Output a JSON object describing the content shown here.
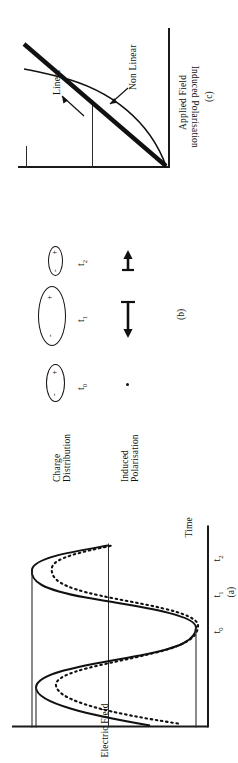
{
  "figure": {
    "orientation": "rotated-90-ccw",
    "ink_color": "#111111"
  },
  "panel_a": {
    "letter": "(a)",
    "y_axis_label": "Electric Field",
    "x_axis_label": "Time",
    "ticks": [
      {
        "label": "t",
        "sub": "0"
      },
      {
        "label": "t",
        "sub": "1"
      },
      {
        "label": "t",
        "sub": "2"
      }
    ],
    "series": [
      {
        "name": "applied-field-wave",
        "style": "solid",
        "type": "sine"
      },
      {
        "name": "polarisation-wave",
        "style": "dotted",
        "type": "distorted-sine"
      }
    ]
  },
  "panel_b": {
    "letter": "(b)",
    "row_labels": [
      {
        "line1": "Charge",
        "line2": "Distribution"
      },
      {
        "line1": "Induced",
        "line2": "Polarisation"
      }
    ],
    "columns": [
      {
        "time_label": "t",
        "time_sub": "0",
        "charge_shape": "ellipse-medium",
        "charge_signs": [
          "-",
          "+"
        ],
        "polarisation_marker": "dot"
      },
      {
        "time_label": "t",
        "time_sub": "1",
        "charge_shape": "ellipse-large",
        "charge_signs": [
          "-",
          "+"
        ],
        "polarisation_marker": "long-arrow-left"
      },
      {
        "time_label": "t",
        "time_sub": "2",
        "charge_shape": "ellipse-small",
        "charge_signs": [
          "-",
          "+"
        ],
        "polarisation_marker": "short-arrow-right"
      }
    ]
  },
  "panel_c": {
    "letter": "(c)",
    "y_axis_label": "Induced Polarisation",
    "x_axis_label": "Applied Field",
    "annotations": [
      {
        "name": "linear-label",
        "text": "Linear"
      },
      {
        "name": "non-linear-label",
        "text": "Non Linear"
      }
    ],
    "curves": [
      {
        "name": "linear-curve",
        "style": "thick-straight"
      },
      {
        "name": "non-linear-curve",
        "style": "thin-saturating"
      }
    ]
  }
}
